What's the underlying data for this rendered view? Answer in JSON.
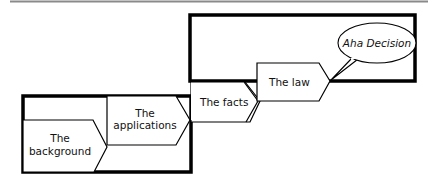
{
  "diagram": {
    "nodes": {
      "background": {
        "line1": "The",
        "line2": "background"
      },
      "applications": {
        "line1": "The",
        "line2": "applications"
      },
      "facts": {
        "label": "The facts"
      },
      "law": {
        "label": "The law"
      },
      "decision": {
        "label": "Aha Decision"
      }
    },
    "colors": {
      "stroke": "#000000",
      "rule": "#8a8a8a",
      "background": "#ffffff"
    }
  }
}
